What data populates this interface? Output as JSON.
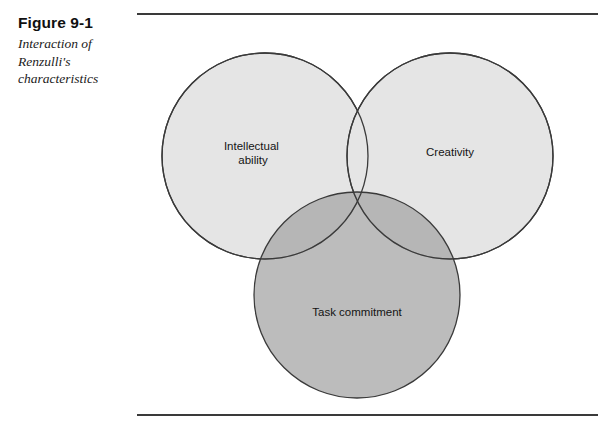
{
  "figure": {
    "title": "Figure 9-1",
    "subtitle_lines": [
      "Interaction of",
      "Renzulli's",
      "characteristics"
    ],
    "subtitle": "Interaction of Renzulli's characteristics"
  },
  "diagram": {
    "type": "venn-3-circle",
    "circles": [
      {
        "id": "intellectual-ability",
        "label_lines": [
          "Intellectual",
          "ability"
        ],
        "label": "Intellectual ability",
        "cx": 128,
        "cy": 140,
        "r": 103,
        "fill": "#e5e5e5",
        "stroke": "#3a3a3a",
        "opacity": 1
      },
      {
        "id": "creativity",
        "label_lines": [
          "Creativity"
        ],
        "label": "Creativity",
        "cx": 313,
        "cy": 140,
        "r": 103,
        "fill": "#e5e5e5",
        "stroke": "#3a3a3a",
        "opacity": 1
      },
      {
        "id": "task-commitment",
        "label_lines": [
          "Task commitment"
        ],
        "label": "Task commitment",
        "cx": 220,
        "cy": 279,
        "r": 103,
        "fill": "#a9a9a9",
        "stroke": "#3a3a3a",
        "opacity": 0.78
      }
    ],
    "label_positions": [
      {
        "id": "intellectual-ability",
        "x": 116,
        "y": 134,
        "line_height": 14
      },
      {
        "id": "creativity",
        "x": 313,
        "y": 140,
        "line_height": 14
      },
      {
        "id": "task-commitment",
        "x": 220,
        "y": 300,
        "line_height": 14
      }
    ],
    "colors": {
      "background": "#ffffff",
      "circle_light": "#e5e5e5",
      "circle_dark": "#a9a9a9",
      "outline": "#3a3a3a",
      "rule": "#3a3a3a",
      "text": "#141414"
    }
  },
  "rules": {
    "top_label": "top-divider",
    "bottom_label": "bottom-divider"
  }
}
